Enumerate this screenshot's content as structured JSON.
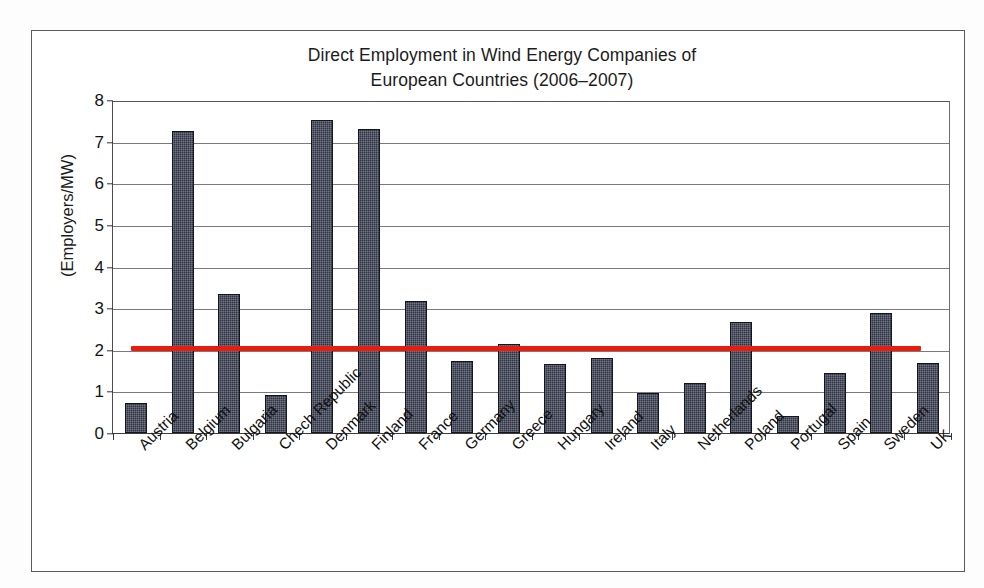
{
  "chart_data": {
    "type": "bar",
    "title": "Direct Employment in Wind Energy Companies of European Countries (2006–2007)",
    "title_line1": "Direct Employment in Wind Energy Companies of",
    "title_line2": "European Countries (2006–2007)",
    "xlabel": "",
    "ylabel": "(Employers/MW)",
    "ylim": [
      0,
      8
    ],
    "ytick_labels": [
      "0",
      "1",
      "2",
      "3",
      "4",
      "5",
      "6",
      "7",
      "8"
    ],
    "ytick_values": [
      0,
      1,
      2,
      3,
      4,
      5,
      6,
      7,
      8
    ],
    "grid": "horizontal",
    "legend": "none",
    "bar_color": "#2f3446",
    "categories": [
      "Austria",
      "Belgium",
      "Bulgaria",
      "Chech Republic",
      "Denmark",
      "Finland",
      "France",
      "Germany",
      "Greece",
      "Hungary",
      "Ireland",
      "Italy",
      "Netherlands",
      "Poland",
      "Portugal",
      "Spain",
      "Sweden",
      "UK"
    ],
    "values": [
      0.72,
      7.25,
      3.33,
      0.92,
      7.52,
      7.3,
      3.17,
      1.72,
      2.13,
      1.65,
      1.8,
      0.97,
      1.2,
      2.67,
      0.42,
      1.44,
      2.89,
      1.68
    ],
    "annotations": [
      {
        "name": "average-reference-line",
        "type": "horizontal-line",
        "value": 2.05,
        "color": "#ea1c0d",
        "spans_categories": [
          "Austria",
          "Sweden"
        ]
      }
    ]
  }
}
